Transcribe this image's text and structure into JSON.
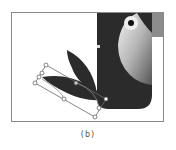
{
  "figure": {
    "caption": "(b)",
    "colors": {
      "body": "#2b2b2b",
      "beak": "#8c8c8c",
      "chest_light": "#e6e6e6",
      "chest_dark": "#6e6e6e",
      "eye": "#111111",
      "eye_ring": "#f0f0f0",
      "frame_border": "#8a8a8a",
      "selection": "#6a6a6a"
    },
    "elements": [
      "toucan-body",
      "toucan-beak",
      "toucan-chest",
      "toucan-eye",
      "wing-feather-upper",
      "wing-feather-lower",
      "selection-bounding-box"
    ]
  }
}
